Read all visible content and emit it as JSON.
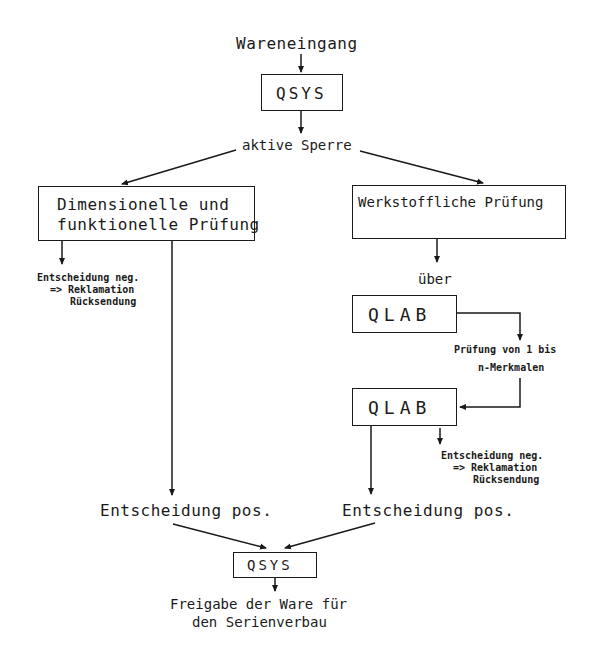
{
  "diagram": {
    "nodes": {
      "start": "Wareneingang",
      "qsys_top": "QSYS",
      "lock": "aktive Sperre",
      "left_check_line1": "Dimensionelle und",
      "left_check_line2": "funktionelle Prüfung",
      "right_check": "Werkstoffliche Prüfung",
      "via": "über",
      "qlab_1": "QLAB",
      "qlab_2": "QLAB",
      "qlab_note_line1": "Prüfung von 1 bis",
      "qlab_note_line2": "n-Merkmalen",
      "left_neg_line1": "Entscheidung neg.",
      "left_neg_line2": "=> Reklamation",
      "left_neg_line3": "Rücksendung",
      "right_neg_line1": "Entscheidung neg.",
      "right_neg_line2": "=> Reklamation",
      "right_neg_line3": "Rücksendung",
      "left_pos": "Entscheidung pos.",
      "right_pos": "Entscheidung pos.",
      "qsys_bottom": "QSYS",
      "end_line1": "Freigabe der Ware für",
      "end_line2": "den Serienverbau"
    },
    "edges": [
      {
        "from": "start",
        "to": "qsys_top"
      },
      {
        "from": "qsys_top",
        "to": "lock"
      },
      {
        "from": "lock",
        "to": "left_check"
      },
      {
        "from": "lock",
        "to": "right_check"
      },
      {
        "from": "left_check",
        "to": "left_neg"
      },
      {
        "from": "left_check",
        "to": "left_pos"
      },
      {
        "from": "right_check",
        "to": "via"
      },
      {
        "from": "qlab_1",
        "to": "qlab_note"
      },
      {
        "from": "qlab_note",
        "to": "qlab_2"
      },
      {
        "from": "qlab_2",
        "to": "right_neg"
      },
      {
        "from": "qlab_2",
        "to": "right_pos"
      },
      {
        "from": "left_pos",
        "to": "qsys_bottom"
      },
      {
        "from": "right_pos",
        "to": "qsys_bottom"
      },
      {
        "from": "qsys_bottom",
        "to": "end"
      }
    ]
  }
}
